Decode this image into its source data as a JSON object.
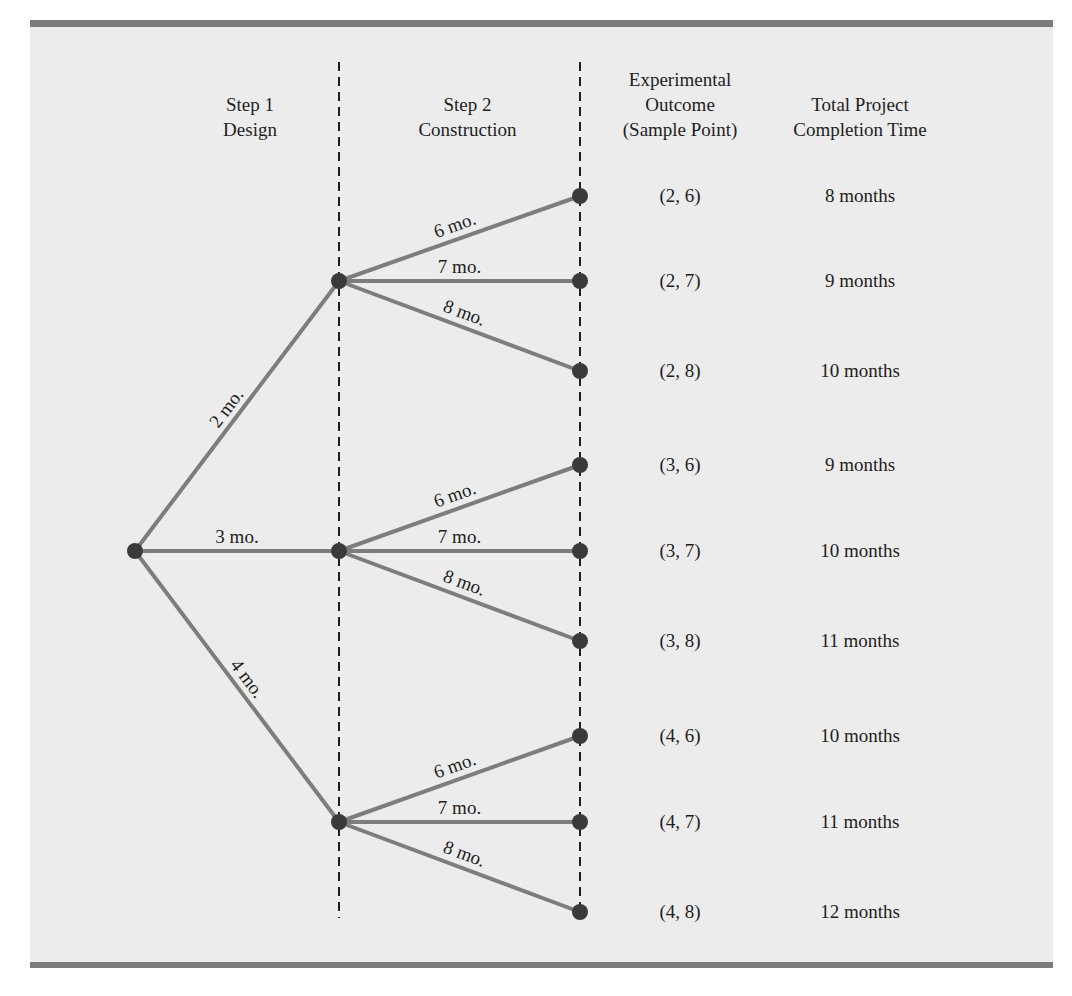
{
  "figure": {
    "colors": {
      "panel_background": "#ececec",
      "rule": "#7c7c7c",
      "branch": "#7d7d7d",
      "node": "#3a3a3a",
      "dashed_line": "#1e1e1e",
      "text": "#1e1e1e"
    }
  },
  "headers": {
    "step1": [
      "Step 1",
      "Design"
    ],
    "step2": [
      "Step 2",
      "Construction"
    ],
    "outcome": [
      "Experimental",
      "Outcome",
      "(Sample Point)"
    ],
    "total": [
      "Total Project",
      "Completion Time"
    ]
  },
  "tree": {
    "root": {
      "x": 135,
      "y": 551
    },
    "step1_branches": [
      {
        "label": "2 mo.",
        "node": {
          "x": 339,
          "y": 281
        }
      },
      {
        "label": "3 mo.",
        "node": {
          "x": 339,
          "y": 551
        }
      },
      {
        "label": "4 mo.",
        "node": {
          "x": 339,
          "y": 822
        }
      }
    ],
    "step2_labels": [
      "6 mo.",
      "7 mo.",
      "8 mo."
    ]
  },
  "outcomes": [
    {
      "point": "(2, 6)",
      "total": "8 months",
      "y": 196
    },
    {
      "point": "(2, 7)",
      "total": "9 months",
      "y": 281
    },
    {
      "point": "(2, 8)",
      "total": "10 months",
      "y": 371
    },
    {
      "point": "(3, 6)",
      "total": "9 months",
      "y": 465
    },
    {
      "point": "(3, 7)",
      "total": "10 months",
      "y": 551
    },
    {
      "point": "(3, 8)",
      "total": "11 months",
      "y": 641
    },
    {
      "point": "(4, 6)",
      "total": "10 months",
      "y": 736
    },
    {
      "point": "(4, 7)",
      "total": "11 months",
      "y": 822
    },
    {
      "point": "(4, 8)",
      "total": "12 months",
      "y": 912
    }
  ]
}
